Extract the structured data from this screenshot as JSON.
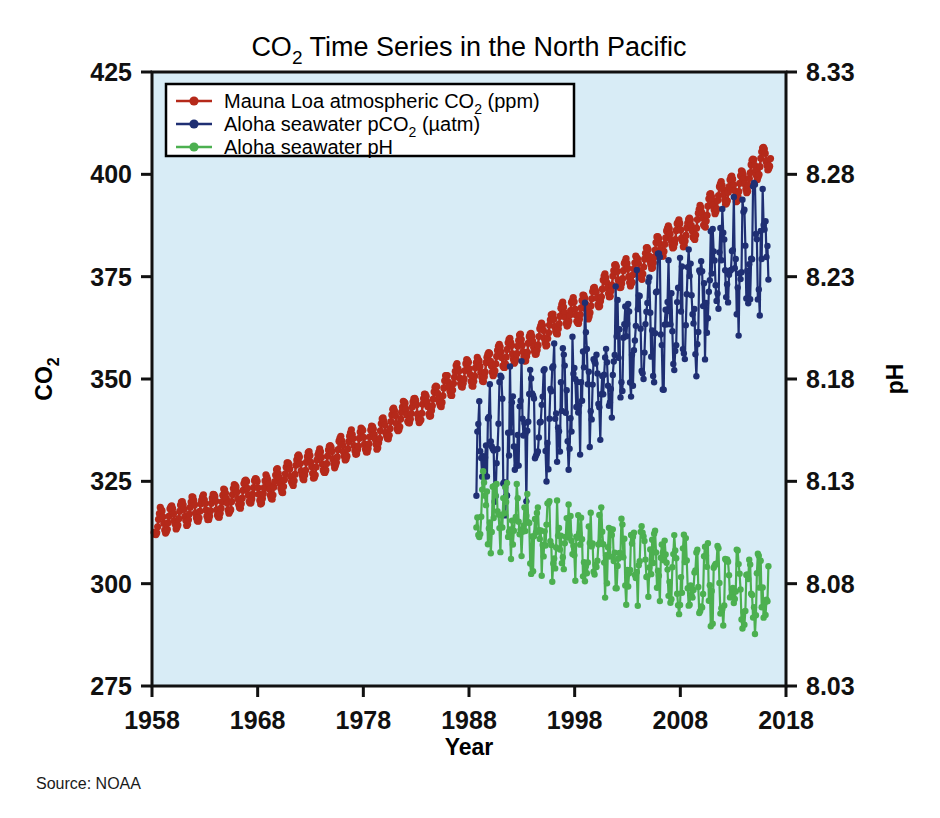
{
  "chart_data": {
    "type": "line",
    "title": "CO2 Time Series in the North Pacific",
    "title_parts": {
      "pre": "CO",
      "sub": "2",
      "post": " Time Series in the North Pacific"
    },
    "xlabel": "Year",
    "ylabel_left": "CO2",
    "ylabel_left_parts": {
      "pre": "CO",
      "sub": "2"
    },
    "ylabel_right": "pH",
    "xlim": [
      1958,
      2018
    ],
    "ylim_left": [
      275,
      425
    ],
    "ylim_right": [
      8.03,
      8.33
    ],
    "xticks": [
      1958,
      1968,
      1978,
      1988,
      1998,
      2008,
      2018
    ],
    "yticks_left": [
      275,
      300,
      325,
      350,
      375,
      400,
      425
    ],
    "yticks_right": [
      "8.03",
      "8.08",
      "8.13",
      "8.18",
      "8.23",
      "8.28",
      "8.33"
    ],
    "grid": false,
    "plot_background": "#d8ecf6",
    "legend_position": "top-left",
    "source": "Source: NOAA",
    "series": [
      {
        "name": "Mauna Loa atmospheric CO2 (ppm)",
        "name_parts": {
          "pre": "Mauna Loa atmospheric CO",
          "sub": "2",
          "post": " (ppm)"
        },
        "color": "#b5291a",
        "axis": "left",
        "marker": "circle",
        "x_start": 1958.2,
        "x_end": 2016.6,
        "sampling_per_year": 12,
        "seasonal_amplitude": 3.2,
        "seasonal_phase": 0.42,
        "noise": 0.35,
        "trend_anchors": [
          [
            1958,
            315.0
          ],
          [
            1963,
            318.5
          ],
          [
            1968,
            322.8
          ],
          [
            1973,
            329.0
          ],
          [
            1978,
            335.0
          ],
          [
            1983,
            342.5
          ],
          [
            1988,
            351.5
          ],
          [
            1993,
            357.5
          ],
          [
            1998,
            366.5
          ],
          [
            2003,
            376.0
          ],
          [
            2008,
            385.5
          ],
          [
            2013,
            396.5
          ],
          [
            2016.6,
            404.5
          ]
        ]
      },
      {
        "name": "Aloha seawater pCO2 (uatm)",
        "name_parts": {
          "pre": "Aloha seawater pCO",
          "sub": "2",
          "post": " (µatm)"
        },
        "color": "#1f2f73",
        "axis": "left",
        "marker": "circle",
        "x_start": 1988.7,
        "x_end": 2016.4,
        "sampling_per_year": 11,
        "seasonal_amplitude": 10.5,
        "seasonal_phase": 0.3,
        "noise": 9.5,
        "trend_anchors": [
          [
            1988.7,
            330.0
          ],
          [
            1991,
            334.0
          ],
          [
            1994,
            340.0
          ],
          [
            1997,
            345.0
          ],
          [
            2000,
            352.0
          ],
          [
            2003,
            357.0
          ],
          [
            2006,
            363.0
          ],
          [
            2009,
            369.0
          ],
          [
            2012,
            376.0
          ],
          [
            2016.4,
            383.0
          ]
        ]
      },
      {
        "name": "Aloha seawater pH",
        "color": "#4cb050",
        "axis": "right",
        "marker": "circle",
        "x_start": 1988.7,
        "x_end": 2016.4,
        "sampling_per_year": 11,
        "seasonal_amplitude": 0.012,
        "seasonal_phase": 0.8,
        "noise": 0.0115,
        "trend_anchors": [
          [
            1988.7,
            8.118
          ],
          [
            1991,
            8.112
          ],
          [
            1994,
            8.106
          ],
          [
            1997,
            8.101
          ],
          [
            2000,
            8.096
          ],
          [
            2003,
            8.092
          ],
          [
            2006,
            8.088
          ],
          [
            2009,
            8.084
          ],
          [
            2012,
            8.08
          ],
          [
            2016.4,
            8.074
          ]
        ]
      }
    ]
  },
  "layout": {
    "plot": {
      "left": 152,
      "top": 72,
      "right": 786,
      "bottom": 686
    },
    "frame_color": "#111111",
    "frame_width": 3
  },
  "legend": {
    "box": {
      "x": 166,
      "y": 84,
      "w": 408,
      "h": 72
    },
    "border_color": "#000000",
    "background": "#ffffff"
  }
}
